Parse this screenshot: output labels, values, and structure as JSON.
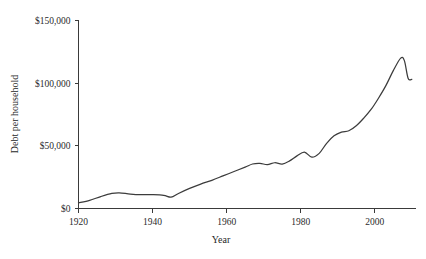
{
  "chart_data": {
    "type": "line",
    "title": "",
    "xlabel": "Year",
    "ylabel": "Debt per household",
    "xlim": [
      1920,
      2011
    ],
    "ylim": [
      0,
      150000
    ],
    "grid": false,
    "legend": "none",
    "line_color": "#3c3c3c",
    "axis_color": "#3a3a3a",
    "background_color": "#ffffff",
    "x_ticks": [
      1920,
      1940,
      1960,
      1980,
      2000
    ],
    "x_tick_labels": [
      "1920",
      "1940",
      "1960",
      "1980",
      "2000"
    ],
    "y_ticks": [
      0,
      50000,
      100000,
      150000
    ],
    "y_tick_labels": [
      "$0",
      "$50,000",
      "$100,000",
      "$150,000"
    ],
    "x": [
      1920,
      1923,
      1926,
      1929,
      1931,
      1934,
      1937,
      1940,
      1943,
      1945,
      1947,
      1950,
      1953,
      1956,
      1959,
      1962,
      1965,
      1967,
      1969,
      1971,
      1973,
      1975,
      1977,
      1979,
      1981,
      1983,
      1985,
      1987,
      1989,
      1991,
      1993,
      1995,
      1997,
      1999,
      2001,
      2003,
      2005,
      2007,
      2008,
      2009,
      2010
    ],
    "y": [
      4500,
      6500,
      9500,
      12000,
      12500,
      11500,
      11000,
      11000,
      10500,
      9000,
      12000,
      16000,
      19500,
      22500,
      26000,
      29500,
      33000,
      35500,
      36000,
      35000,
      36500,
      35500,
      38000,
      42000,
      45000,
      41000,
      44000,
      52000,
      58000,
      61000,
      62000,
      66000,
      72000,
      79000,
      88000,
      98000,
      110000,
      120000,
      118000,
      104000,
      103000
    ]
  },
  "axis": {
    "y_title": "Debt per household",
    "x_title": "Year"
  }
}
